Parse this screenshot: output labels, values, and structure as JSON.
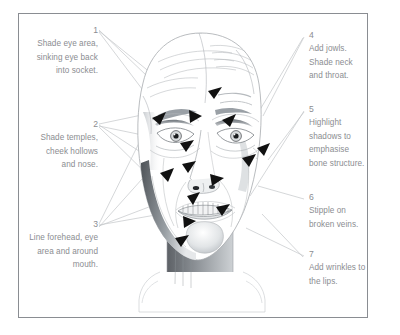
{
  "figure": {
    "border_color": "#8a8d92",
    "text_color": "#8b8d91",
    "background": "#ffffff",
    "line_color": "#b9bbbe",
    "arrow_color": "#111111"
  },
  "callouts": {
    "left": [
      {
        "number": "1",
        "text": "Shade eye area, sinking eye back into socket.",
        "lines": [
          "Shade eye",
          "area, sinking",
          "eye back into",
          "socket."
        ]
      },
      {
        "number": "2",
        "text": "Shade temples, cheek hollows and nose.",
        "lines": [
          "Shade",
          "temples,",
          "cheek",
          "hollows and",
          "nose."
        ]
      },
      {
        "number": "3",
        "text": "Line forehead, eye area and around mouth.",
        "lines": [
          "Line forehead,",
          "eye area and",
          "around",
          "mouth."
        ]
      }
    ],
    "right": [
      {
        "number": "4",
        "text": "Add jowls. Shade neck and throat.",
        "lines": [
          "Add jowls.",
          "Shade neck and",
          "throat."
        ]
      },
      {
        "number": "5",
        "text": "Highlight shadows to emphasise bone structure.",
        "lines": [
          "Highlight",
          "shadows to",
          "emphasise",
          "bone structure."
        ]
      },
      {
        "number": "6",
        "text": "Stipple on broken veins.",
        "lines": [
          "Stipple on",
          "broken veins."
        ]
      },
      {
        "number": "7",
        "text": "Add wrinkles to the lips.",
        "lines": [
          "Add wrinkles to",
          "the lips."
        ]
      }
    ]
  },
  "illustration": {
    "subject": "frontal human head and neck line drawing with shading",
    "features": [
      "forehead",
      "eyes",
      "temples",
      "cheeks",
      "nose",
      "mouth",
      "chin",
      "jowls",
      "neck",
      "throat"
    ],
    "arrow_count": 14
  }
}
